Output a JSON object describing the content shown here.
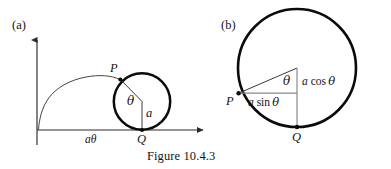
{
  "figure": {
    "caption": "Figure 10.4.3",
    "panels": [
      {
        "tag": "(a)",
        "description": "cycloid generated by rolling circle",
        "labels": {
          "point_p": "P",
          "point_q": "Q",
          "angle_theta": "θ",
          "radius_a": "a",
          "arc_length": "aθ"
        },
        "axes": {
          "x_axis": "horizontal axis with arrow",
          "y_axis": "vertical axis with arrow"
        }
      },
      {
        "tag": "(b)",
        "description": "detail of rolling circle showing components",
        "labels": {
          "point_p": "P",
          "point_q": "Q",
          "angle_theta": "θ",
          "vertical_component_a": "a",
          "vertical_component_fn": "cos",
          "vertical_component_arg": "θ",
          "horizontal_component_a": "a",
          "horizontal_component_fn": "sin",
          "horizontal_component_arg": "θ"
        }
      }
    ]
  },
  "colors": {
    "ink": "#141414",
    "circle_stroke": "#000000",
    "thin_stroke": "#3a3a3a",
    "background": "#ffffff"
  },
  "geometry": {
    "panel_a": {
      "circle_center": [
        142,
        101
      ],
      "circle_radius": 28,
      "origin": [
        37,
        130
      ],
      "x_axis_end": [
        207,
        130
      ],
      "y_axis_top": [
        37,
        36
      ],
      "point_p": [
        120,
        80
      ],
      "point_q": [
        142,
        130
      ]
    },
    "panel_b": {
      "circle_center": [
        297,
        68
      ],
      "circle_radius": 59,
      "point_p": [
        238,
        93
      ],
      "point_q": [
        297,
        127
      ],
      "corner": [
        297,
        93
      ]
    }
  }
}
